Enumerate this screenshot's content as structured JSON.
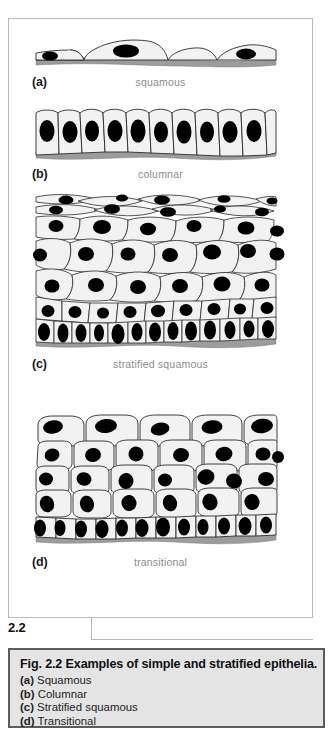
{
  "figure": {
    "tab_number": "2.2",
    "panels": [
      {
        "letter": "(a)",
        "name": "squamous",
        "type": "simple-squamous"
      },
      {
        "letter": "(b)",
        "name": "columnar",
        "type": "simple-columnar"
      },
      {
        "letter": "(c)",
        "name": "stratified squamous",
        "type": "stratified-squamous"
      },
      {
        "letter": "(d)",
        "name": "transitional",
        "type": "transitional"
      }
    ]
  },
  "caption": {
    "title": "Fig. 2.2  Examples of simple and stratified epithelia.",
    "items": [
      {
        "label": "(a)",
        "text": "Squamous"
      },
      {
        "label": "(b)",
        "text": "Columnar"
      },
      {
        "label": "(c)",
        "text": "Stratified squamous"
      },
      {
        "label": "(d)",
        "text": "Transitional"
      }
    ]
  },
  "colors": {
    "cell_fill": "#f2f2f2",
    "cell_outline": "#2b2b2b",
    "nucleus": "#000000",
    "basement_membrane": "#9c9c9c",
    "panel_border": "#b9b9b9",
    "caption_background": "#e4e4e4",
    "caption_border": "#5c5c5c",
    "label_text": "#8d8d8d"
  }
}
